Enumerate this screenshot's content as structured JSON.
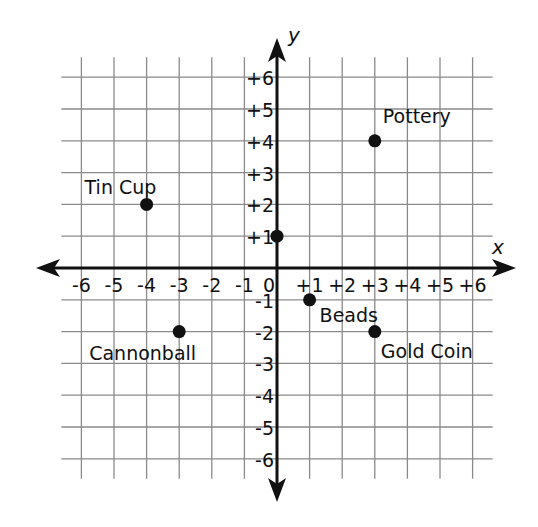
{
  "chart_data": {
    "type": "scatter",
    "title": "",
    "xlabel": "x",
    "ylabel": "y",
    "xlim": [
      -6,
      6
    ],
    "ylim": [
      -6,
      6
    ],
    "grid": true,
    "x_ticks": [
      "-6",
      "-5",
      "-4",
      "-3",
      "-2",
      "-1",
      "0",
      "+1",
      "+2",
      "+3",
      "+4",
      "+5",
      "+6"
    ],
    "y_ticks": [
      "+6",
      "+5",
      "+4",
      "+3",
      "+2",
      "+1",
      "-1",
      "-2",
      "-3",
      "-4",
      "-5",
      "-6"
    ],
    "points": [
      {
        "label": "Pottery",
        "x": 3,
        "y": 4
      },
      {
        "label": "Tin Cup",
        "x": -4,
        "y": 2
      },
      {
        "label": "",
        "x": 0,
        "y": 1
      },
      {
        "label": "Beads",
        "x": 1,
        "y": -1
      },
      {
        "label": "Cannonball",
        "x": -3,
        "y": -2
      },
      {
        "label": "Gold Coin",
        "x": 3,
        "y": -2
      }
    ]
  },
  "colors": {
    "grid": "#8a8a8a",
    "axis": "#111111",
    "point": "#111111",
    "background": "#ffffff"
  }
}
